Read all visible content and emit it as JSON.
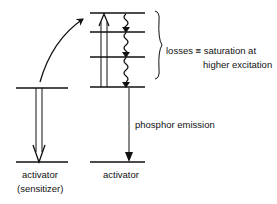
{
  "diagram": {
    "type": "energy-level-diagram",
    "left_system": {
      "label_line1": "activator",
      "label_line2": "(sensitizer)",
      "transition": "downward double arrow (de-excitation, energy transfer)"
    },
    "right_system": {
      "label": "activator",
      "levels": 4,
      "transitions": [
        "upward double arrow (excitation)",
        "wavy downward arrows (non-radiative losses)",
        "downward arrow (phosphor emission)"
      ]
    },
    "annotations": {
      "losses_line1": "losses ≡ saturation at",
      "losses_line2": "higher excitation",
      "emission": "phosphor emission"
    }
  }
}
